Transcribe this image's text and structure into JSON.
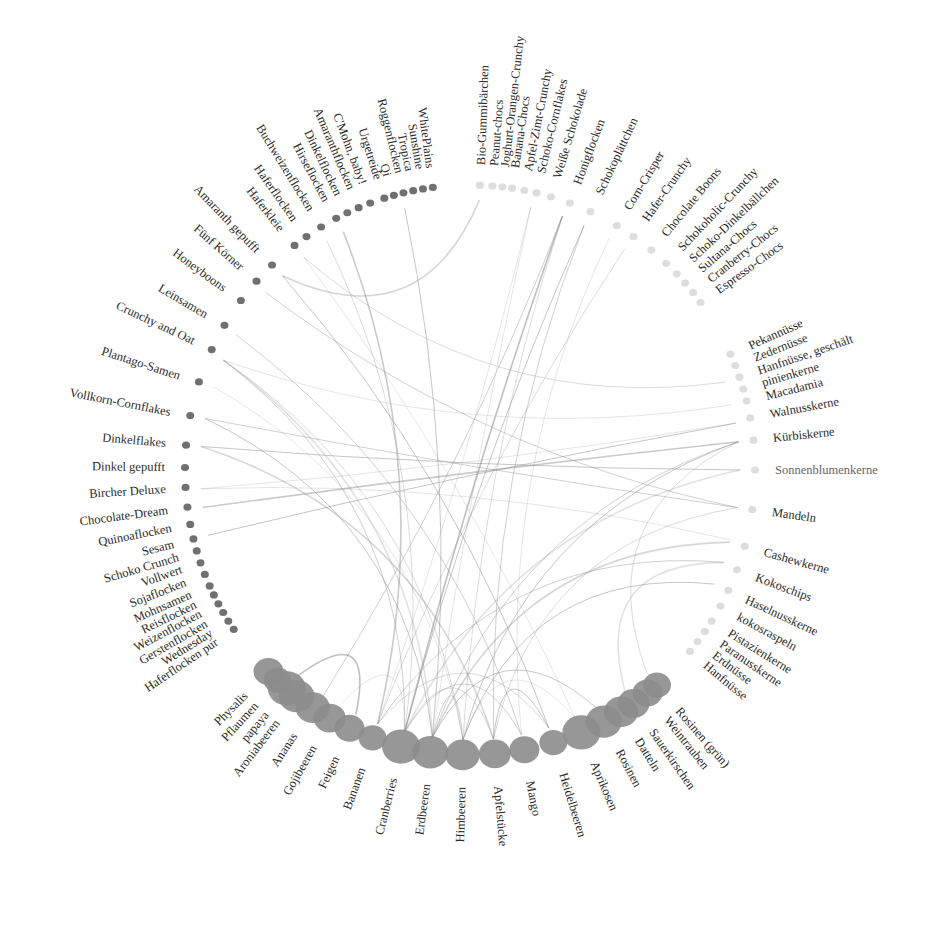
{
  "chart_data": {
    "type": "chord",
    "title": "",
    "center": [
      470,
      470
    ],
    "groups": [
      {
        "name": "Nüsse & Kerne",
        "items": [
          {
            "label": "Pekannüsse",
            "angle": -24
          },
          {
            "label": "Zedernüsse",
            "angle": -21.5
          },
          {
            "label": "Hanfnüsse, geschält",
            "angle": -19
          },
          {
            "label": "pinienkerne",
            "angle": -16.5
          },
          {
            "label": "Macadamia",
            "angle": -14
          },
          {
            "label": "Walnusskerne",
            "angle": -10.5
          },
          {
            "label": "Kürbiskerne",
            "angle": -6
          },
          {
            "label": "Sonnenblumenkerne",
            "angle": 0,
            "light": true
          },
          {
            "label": "Mandeln",
            "angle": 8
          },
          {
            "label": "Cashewkerne",
            "angle": 15.5
          },
          {
            "label": "Kokoschips",
            "angle": 20.5
          },
          {
            "label": "Haselnusskerne",
            "angle": 25
          },
          {
            "label": "kokosraspeln",
            "angle": 28.5
          },
          {
            "label": "Pistazienkerne",
            "angle": 32
          },
          {
            "label": "Paranusskerne",
            "angle": 34.5
          },
          {
            "label": "Erdnüsse",
            "angle": 37
          },
          {
            "label": "Hanfnüsse",
            "angle": 39.5
          }
        ]
      },
      {
        "name": "Früchte",
        "items": [
          {
            "label": "Rosinen (grün)",
            "angle": 49
          },
          {
            "label": "Weintrauben",
            "angle": 51.5
          },
          {
            "label": "Sauerkirschen",
            "angle": 55
          },
          {
            "label": "Datteln",
            "angle": 58
          },
          {
            "label": "Rosinen",
            "angle": 62
          },
          {
            "label": "Aprikosen",
            "angle": 67
          },
          {
            "label": "Heidelbeeren",
            "angle": 73
          },
          {
            "label": "Mango",
            "angle": 79
          },
          {
            "label": "Apfelstücke",
            "angle": 85
          },
          {
            "label": "Himbeeren",
            "angle": 91.5
          },
          {
            "label": "Erdbeeren",
            "angle": 98
          },
          {
            "label": "Cranberries",
            "angle": 104
          },
          {
            "label": "Bananen",
            "angle": 110
          },
          {
            "label": "Feigen",
            "angle": 115
          },
          {
            "label": "Gojibeeren",
            "angle": 119.5
          },
          {
            "label": "Ananas",
            "angle": 123.5
          },
          {
            "label": "Aroniabeeren",
            "angle": 127.5
          },
          {
            "label": "papaya",
            "angle": 130
          },
          {
            "label": "Pflaumen",
            "angle": 132.5
          },
          {
            "label": "Physalis",
            "angle": 135
          }
        ]
      },
      {
        "name": "Flocken & Getreide",
        "items": [
          {
            "label": "Haferflocken pur",
            "angle": 146
          },
          {
            "label": "Wednesday",
            "angle": 148
          },
          {
            "label": "Gerstenflocken",
            "angle": 150
          },
          {
            "label": "Weizenflocken",
            "angle": 152
          },
          {
            "label": "Reisflocken",
            "angle": 154
          },
          {
            "label": "Mohnsamen",
            "angle": 156
          },
          {
            "label": "Sojaflocken",
            "angle": 158.5
          },
          {
            "label": "Vollwert",
            "angle": 161
          },
          {
            "label": "Schoko Crunch",
            "angle": 163.5
          },
          {
            "label": "Sesam",
            "angle": 166
          },
          {
            "label": "Quinoaflocken",
            "angle": 169
          },
          {
            "label": "Chocolate-Dream",
            "angle": 172.5
          },
          {
            "label": "Bircher Deluxe",
            "angle": 176.5
          },
          {
            "label": "Dinkel gepufft",
            "angle": 180.5
          },
          {
            "label": "Dinkelflakes",
            "angle": 185
          },
          {
            "label": "Vollkorn-Cornflakes",
            "angle": 191
          },
          {
            "label": "Plantago-Samen",
            "angle": 198
          },
          {
            "label": "Crunchy and Oat",
            "angle": 205
          },
          {
            "label": "Leinsamen",
            "angle": 210.5
          },
          {
            "label": "Honeyboons",
            "angle": 216.5
          },
          {
            "label": "Fünf Körner",
            "angle": 221.5
          },
          {
            "label": "Amaranth gepufft",
            "angle": 226
          },
          {
            "label": "Haferkleie",
            "angle": 232
          },
          {
            "label": "Haferflocken",
            "angle": 235
          },
          {
            "label": "Buchweizenflocken",
            "angle": 238.5
          },
          {
            "label": "Hirseflocken",
            "angle": 242
          },
          {
            "label": "Dinkelflocken",
            "angle": 244.5
          },
          {
            "label": "Amaranthflocken",
            "angle": 247
          },
          {
            "label": "C'Mohn, baby!",
            "angle": 249.5
          },
          {
            "label": "Urgetreide",
            "angle": 252.5
          },
          {
            "label": "Qi",
            "angle": 254.5
          },
          {
            "label": "Roggenflocken",
            "angle": 256.5
          },
          {
            "label": "Tropica",
            "angle": 258.5
          },
          {
            "label": "Sunshine",
            "angle": 260.5
          },
          {
            "label": "WhitePlains",
            "angle": 262.5
          }
        ]
      },
      {
        "name": "Süßes & Schoko",
        "items": [
          {
            "label": "Bio-Gummibärchen",
            "angle": 272
          },
          {
            "label": "Peanut-chocs",
            "angle": 274.5
          },
          {
            "label": "Joghurt-Orangen-Crunchy",
            "angle": 276.5
          },
          {
            "label": "Banana-Chocs",
            "angle": 278.5
          },
          {
            "label": "Apfel-Zimt-Crunchy",
            "angle": 281
          },
          {
            "label": "Schoko-Cornflakes",
            "angle": 283.5
          },
          {
            "label": "Weiße Schokolade",
            "angle": 286.5
          },
          {
            "label": "Honigflocken",
            "angle": 290.5
          },
          {
            "label": "Schokoplättchen",
            "angle": 295
          },
          {
            "label": "Corn-Crisper",
            "angle": 301
          },
          {
            "label": "Hafer-Crunchy",
            "angle": 305
          },
          {
            "label": "Chocolate Boons",
            "angle": 309.5
          },
          {
            "label": "Schokoholic-Crunchy",
            "angle": 313.5
          },
          {
            "label": "Schoko-Dinkelbällchen",
            "angle": 316.5
          },
          {
            "label": "Sultana-Chocs",
            "angle": 319
          },
          {
            "label": "Cranberry-Chocs",
            "angle": 321.5
          },
          {
            "label": "Espresso-Chocs",
            "angle": 324
          }
        ]
      }
    ],
    "links": [
      [
        204,
        98
      ],
      [
        204,
        91.5
      ],
      [
        204,
        104
      ],
      [
        191,
        98
      ],
      [
        198,
        91.5
      ],
      [
        185,
        85
      ],
      [
        210,
        79
      ],
      [
        226,
        73
      ],
      [
        232,
        67
      ],
      [
        238,
        104
      ],
      [
        242,
        110
      ],
      [
        256,
        98
      ],
      [
        283,
        98
      ],
      [
        290,
        91.5
      ],
      [
        295,
        85
      ],
      [
        290,
        104
      ],
      [
        301,
        79
      ],
      [
        305,
        110
      ],
      [
        -6,
        98
      ],
      [
        -6,
        91.5
      ],
      [
        0,
        104
      ],
      [
        8,
        85
      ],
      [
        8,
        191
      ],
      [
        0,
        185
      ],
      [
        -10,
        176
      ],
      [
        15.5,
        98
      ],
      [
        20,
        110
      ],
      [
        25,
        91.5
      ],
      [
        -14,
        204
      ],
      [
        -19,
        232
      ],
      [
        -6,
        172
      ],
      [
        62,
        98
      ],
      [
        67,
        91.5
      ],
      [
        73,
        110
      ],
      [
        79,
        104
      ],
      [
        115,
        130
      ],
      [
        119,
        104
      ],
      [
        85,
        104
      ],
      [
        91.5,
        98
      ],
      [
        73,
        85
      ],
      [
        55,
        20
      ],
      [
        49,
        -6
      ],
      [
        123,
        290
      ],
      [
        104,
        295
      ],
      [
        110,
        283
      ],
      [
        226,
        272
      ],
      [
        221,
        8
      ],
      [
        166,
        -10
      ],
      [
        176,
        15
      ]
    ],
    "colors": {
      "background": "#ffffff",
      "text": "#2a2a2a",
      "link": "#8a8a8a",
      "icon_dark": "#333333",
      "icon_mid": "#8c8c8c",
      "icon_light": "#cfcfcf"
    }
  }
}
